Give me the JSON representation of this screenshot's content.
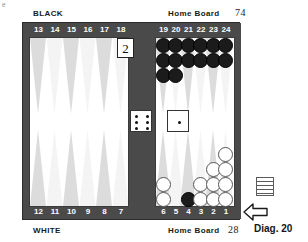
{
  "page": {
    "corner_mark": "e",
    "diagram_label": "Diag. 20"
  },
  "top": {
    "player_label": "BLACK",
    "home_board_label": "Home Board",
    "pip_count": "74"
  },
  "bottom": {
    "player_label": "WHITE",
    "home_board_label": "Home Board",
    "pip_count": "28"
  },
  "point_numbers": {
    "top": [
      "13",
      "14",
      "15",
      "16",
      "17",
      "18",
      "19",
      "20",
      "21",
      "22",
      "23",
      "24"
    ],
    "bottom": [
      "12",
      "11",
      "10",
      "9",
      "8",
      "7",
      "6",
      "5",
      "4",
      "3",
      "2",
      "1"
    ]
  },
  "doubling_cube": {
    "value": "2",
    "owner": "black"
  },
  "dice": [
    {
      "name": "die-left",
      "value": "6"
    },
    {
      "name": "die-right",
      "value": "1"
    }
  ],
  "board_state": {
    "points": [
      {
        "point": "13",
        "color": "none",
        "count": 0
      },
      {
        "point": "14",
        "color": "none",
        "count": 0
      },
      {
        "point": "15",
        "color": "none",
        "count": 0
      },
      {
        "point": "16",
        "color": "none",
        "count": 0
      },
      {
        "point": "17",
        "color": "none",
        "count": 0
      },
      {
        "point": "18",
        "color": "none",
        "count": 0
      },
      {
        "point": "19",
        "color": "black",
        "count": 3
      },
      {
        "point": "20",
        "color": "black",
        "count": 3
      },
      {
        "point": "21",
        "color": "black",
        "count": 2
      },
      {
        "point": "22",
        "color": "black",
        "count": 2
      },
      {
        "point": "23",
        "color": "black",
        "count": 2
      },
      {
        "point": "24",
        "color": "black",
        "count": 2
      },
      {
        "point": "12",
        "color": "none",
        "count": 0
      },
      {
        "point": "11",
        "color": "none",
        "count": 0
      },
      {
        "point": "10",
        "color": "none",
        "count": 0
      },
      {
        "point": "9",
        "color": "none",
        "count": 0
      },
      {
        "point": "8",
        "color": "none",
        "count": 0
      },
      {
        "point": "7",
        "color": "none",
        "count": 0
      },
      {
        "point": "6",
        "color": "white",
        "count": 2
      },
      {
        "point": "5",
        "color": "none",
        "count": 0
      },
      {
        "point": "4",
        "color": "black",
        "count": 1
      },
      {
        "point": "3",
        "color": "white",
        "count": 2
      },
      {
        "point": "2",
        "color": "white",
        "count": 3
      },
      {
        "point": "1",
        "color": "white",
        "count": 4
      }
    ]
  },
  "colors": {
    "board_frame": "#4a4a4a",
    "field": "#ffffff",
    "point_light": "#dcdcdc",
    "point_pale": "#f4f4f4",
    "checker_white": "#ffffff",
    "checker_black": "#1b1b1b"
  }
}
